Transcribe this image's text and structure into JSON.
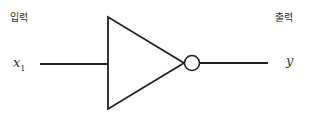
{
  "labels": {
    "input_title": "입력",
    "output_title": "출력",
    "input_var": "x",
    "input_sub": "1",
    "output_var": "y"
  },
  "diagram": {
    "type": "NOT gate (inverter)",
    "stroke_color": "#222222"
  }
}
